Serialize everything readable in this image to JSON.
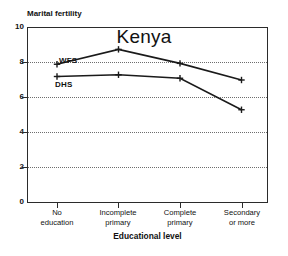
{
  "chart_data": {
    "type": "line",
    "title": "Kenya",
    "xlabel": "Educational level",
    "ylabel": "Marital fertility",
    "categories": [
      "No education",
      "Incomplete primary",
      "Complete primary",
      "Secondary or more"
    ],
    "category_lines": [
      [
        "No",
        "education"
      ],
      [
        "Incomplete",
        "primary"
      ],
      [
        "Complete",
        "primary"
      ],
      [
        "Secondary",
        "or more"
      ]
    ],
    "series": [
      {
        "name": "WFS",
        "values": [
          7.9,
          8.75,
          7.95,
          7.0
        ]
      },
      {
        "name": "DHS",
        "values": [
          7.2,
          7.3,
          7.1,
          5.3
        ]
      }
    ],
    "ylim": [
      0,
      10
    ],
    "yticks": [
      0,
      2,
      4,
      6,
      8,
      10
    ],
    "ytick_labels": [
      "0",
      "2",
      "4",
      "6",
      "8",
      "10"
    ],
    "grid": "horizontal-dotted",
    "gridlines_at": [
      2,
      4,
      6,
      8
    ],
    "legend": "inline-series-labels",
    "line_color": "#1a1a1a",
    "frame_color": "#2b2b2b",
    "grid_color": "#6e6e6e",
    "marker": "plus"
  }
}
